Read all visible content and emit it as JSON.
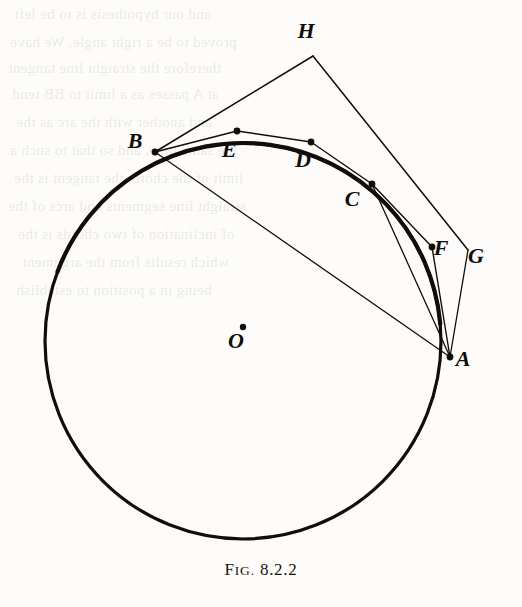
{
  "figure": {
    "caption_prefix_first": "F",
    "caption_prefix_rest": "IG.",
    "caption_number": "8.2.2",
    "caption_full": "FIG. 8.2.2",
    "ink_color": "#100d0a",
    "paper_color": "#fdfcfa"
  },
  "geometry": {
    "circle": {
      "cx": 243,
      "cy": 341,
      "r": 198,
      "stroke_width": 3.2
    },
    "center_dot": {
      "x": 243,
      "y": 327,
      "r": 3.2
    }
  },
  "points": [
    {
      "id": "A",
      "label": "A",
      "x": 450,
      "y": 357,
      "label_x": 463,
      "label_y": 366,
      "dot": true
    },
    {
      "id": "B",
      "label": "B",
      "x": 155,
      "y": 152,
      "label_x": 135,
      "label_y": 148,
      "dot": true
    },
    {
      "id": "C",
      "label": "C",
      "x": 372,
      "y": 184,
      "label_x": 352,
      "label_y": 206,
      "dot": true
    },
    {
      "id": "D",
      "label": "D",
      "x": 311,
      "y": 142,
      "label_x": 303,
      "label_y": 167,
      "dot": true
    },
    {
      "id": "E",
      "label": "E",
      "x": 237,
      "y": 131,
      "label_x": 229,
      "label_y": 157,
      "dot": true
    },
    {
      "id": "F",
      "label": "F",
      "x": 432,
      "y": 247,
      "label_x": 441,
      "label_y": 255,
      "dot": true
    },
    {
      "id": "G",
      "label": "G",
      "x": 468,
      "y": 250,
      "label_x": 476,
      "label_y": 263,
      "dot": false
    },
    {
      "id": "H",
      "label": "H",
      "x": 313,
      "y": 56,
      "label_x": 306,
      "label_y": 38,
      "dot": false
    },
    {
      "id": "O",
      "label": "O",
      "x": 243,
      "y": 341,
      "label_x": 236,
      "label_y": 348,
      "dot": false
    }
  ],
  "segments": [
    {
      "name": "tangent-B-H",
      "from": "B",
      "to": "H",
      "width": 1.5
    },
    {
      "name": "tangent-H-G",
      "from": "H",
      "to": "G",
      "width": 1.5
    },
    {
      "name": "tangent-G-A",
      "from": "G",
      "to": "A",
      "width": 1.3
    },
    {
      "name": "chord-B-A",
      "from": "B",
      "to": "A",
      "width": 1.3
    },
    {
      "name": "chord-B-E",
      "from": "B",
      "to": "E",
      "width": 1.4
    },
    {
      "name": "chord-E-D",
      "from": "E",
      "to": "D",
      "width": 1.4
    },
    {
      "name": "chord-D-C",
      "from": "D",
      "to": "C",
      "width": 1.4
    },
    {
      "name": "chord-C-A",
      "from": "C",
      "to": "A",
      "width": 1.3
    },
    {
      "name": "chord-C-F",
      "from": "C",
      "to": "F",
      "width": 1.4
    },
    {
      "name": "chord-F-A",
      "from": "F",
      "to": "A",
      "width": 1.4
    }
  ],
  "arcs": [
    {
      "name": "thick-arc-B-to-A",
      "start_deg": 200.5,
      "end_deg": 355.0,
      "width": 4.2
    }
  ],
  "bleed_text": {
    "note": "faint show-through text from reverse side of page",
    "lines": [
      {
        "text": "and our hypothesis  is  to  be  left",
        "x": 14,
        "y": 6
      },
      {
        "text": "proved  to  be  a  right  angle.  We  have",
        "x": 10,
        "y": 34
      },
      {
        "text": "therefore  the  straight  line  tangent",
        "x": 8,
        "y": 60
      },
      {
        "text": "at  A  passes  as  a  limit  to  BB  tend",
        "x": 12,
        "y": 86
      },
      {
        "text": "and  another  with  the  arc  as  the",
        "x": 16,
        "y": 114
      },
      {
        "text": "the  same  time,  and  so  that  to  such  a",
        "x": 10,
        "y": 142
      },
      {
        "text": "limit  of  the  chord,  the  tangent  is  the",
        "x": 14,
        "y": 170
      },
      {
        "text": "straight  line  segments  and  arcs  of  the",
        "x": 8,
        "y": 198
      },
      {
        "text": "of  inclination  of  two  chords  is  the",
        "x": 18,
        "y": 226
      },
      {
        "text": "which  results  from  the  argument",
        "x": 22,
        "y": 254
      },
      {
        "text": "being  in  a  position  to  establish",
        "x": 16,
        "y": 282
      }
    ]
  }
}
